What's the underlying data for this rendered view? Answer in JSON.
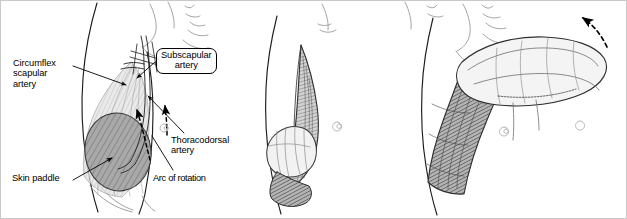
{
  "figure": {
    "name": "latissimus-dorsi-flap-diagram",
    "panel_count": 3,
    "border_color": "#c8c8c8",
    "background_color": "#ffffff"
  },
  "labels": {
    "circumflex_scapular_artery": "Circumflex\nscapular\nartery",
    "subscapular_artery": "Subscapular\nartery",
    "thoracodorsal_artery": "Thoracodorsal\nartery",
    "skin_paddle": "Skin paddle",
    "arc_of_rotation": "Arc of rotation"
  },
  "panels": [
    {
      "id": "panel-1",
      "name": "flap-design-panel",
      "description": "Lateral torso with skin paddle marked over latissimus dorsi, arterial pedicle labelled"
    },
    {
      "id": "panel-2",
      "name": "flap-elevation-panel",
      "description": "Flap elevated on its pedicle beside the chest wall"
    },
    {
      "id": "panel-3",
      "name": "flap-rotation-panel",
      "description": "Flap rotated superiorly to head and neck region along arc of rotation"
    }
  ],
  "colors": {
    "ink": "#000000",
    "skin_paddle_fill": "#a9a9a9",
    "skin_paddle_hatch": "#6e6e6e",
    "muscle_light": "#d9d9d9",
    "muscle_mid": "#9a9a9a",
    "muscle_dark": "#5a5a5a",
    "outline_light": "#8c8c8c"
  },
  "annotations": {
    "leader_lines": 5,
    "solid_arrows": 3,
    "dashed_arc_arrows": 2,
    "dashed_rotation_arrow_panel3": 1
  }
}
